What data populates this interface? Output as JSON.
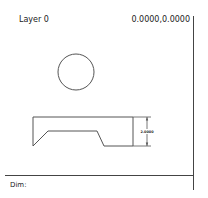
{
  "header": {
    "layer_label": "Layer 0",
    "coordinates": "0.0000,0.0000"
  },
  "drawing": {
    "circle": {
      "cx": 76,
      "cy": 72,
      "r": 18
    },
    "part_outline_points": "33,117 133,117 133,146 104,146 97,131 48,131 33,146 33,117",
    "dimension": {
      "value": "2.0000",
      "orientation": "vertical"
    },
    "stroke_color": "#555555"
  },
  "status_bar": {
    "dim_label": "Dim:"
  }
}
